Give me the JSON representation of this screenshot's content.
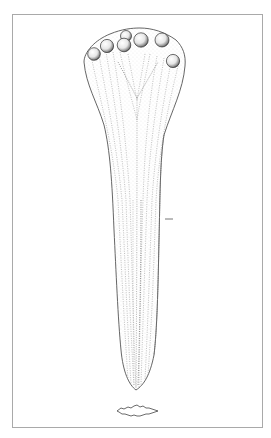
{
  "figure": {
    "frame_color": "#a9a9a9",
    "line_color": "#555555",
    "stipple_color": "#8a8a8a",
    "background": "#ffffff",
    "knobs_count": 7,
    "parts": [
      "knobbed head",
      "fluted shaft",
      "pointed tip",
      "scale mark",
      "cross-section"
    ]
  }
}
